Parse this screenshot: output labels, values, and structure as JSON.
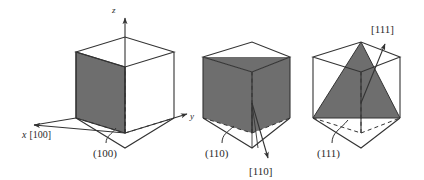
{
  "figure": {
    "background_color": "#ffffff",
    "line_color": "#333333",
    "shade_color": "#6e6e6e",
    "cells": [
      {
        "id": "cube-100",
        "plane_label": "(100)",
        "direction_label": "[100]",
        "axis_labels": {
          "x": "x",
          "y": "y",
          "z": "z"
        },
        "x_axis_combined": "x [100]",
        "shaded_shape": "square-face"
      },
      {
        "id": "cube-110",
        "plane_label": "(110)",
        "direction_label": "[110]",
        "shaded_shape": "diagonal-rectangle"
      },
      {
        "id": "cube-111",
        "plane_label": "(111)",
        "direction_label": "[111]",
        "shaded_shape": "triangle"
      }
    ]
  },
  "labels": {
    "z_axis": "z",
    "y_axis": "y",
    "x_axis_italic": "x",
    "x_axis_index": "[100]",
    "plane_100": "(100)",
    "plane_110": "(110)",
    "dir_110": "[110]",
    "plane_111": "(111)",
    "dir_111": "[111]"
  }
}
